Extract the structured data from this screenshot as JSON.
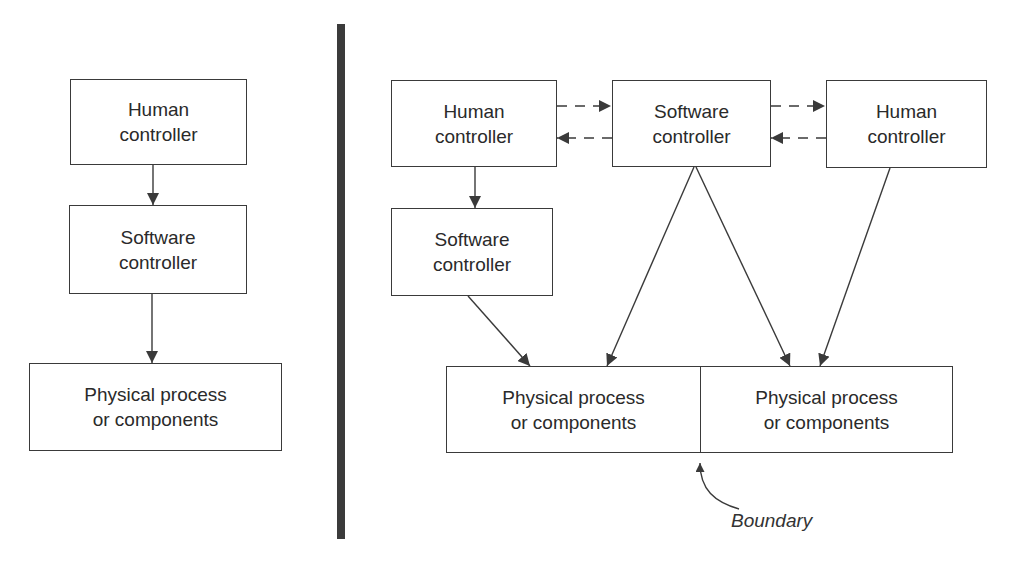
{
  "left_panel": {
    "human_controller": {
      "line1": "Human",
      "line2": "controller"
    },
    "software_controller": {
      "line1": "Software",
      "line2": "controller"
    },
    "physical": {
      "line1": "Physical process",
      "line2": "or components"
    }
  },
  "right_panel": {
    "human_controller_left": {
      "line1": "Human",
      "line2": "controller"
    },
    "software_controller_top": {
      "line1": "Software",
      "line2": "controller"
    },
    "human_controller_right": {
      "line1": "Human",
      "line2": "controller"
    },
    "software_controller_lower": {
      "line1": "Software",
      "line2": "controller"
    },
    "physical_left": {
      "line1": "Physical process",
      "line2": "or components"
    },
    "physical_right": {
      "line1": "Physical process",
      "line2": "or components"
    },
    "boundary_label": "Boundary"
  },
  "caption": "Figure 7.1",
  "colors": {
    "line": "#3a3a3a",
    "bar": "#3b3b3b",
    "background": "#ffffff"
  }
}
